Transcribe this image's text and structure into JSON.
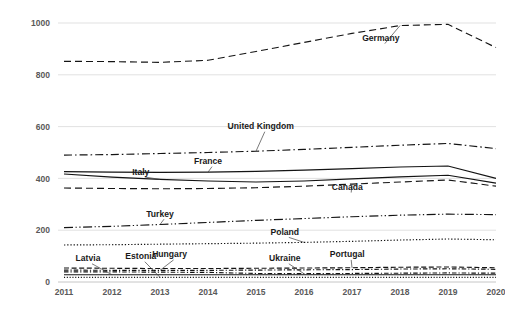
{
  "chart_data": {
    "type": "line",
    "title": "",
    "subtitle": "",
    "xlabel": "",
    "ylabel": "",
    "x": [
      2011,
      2012,
      2013,
      2014,
      2015,
      2016,
      2017,
      2018,
      2019,
      2020
    ],
    "categories": [
      "2011",
      "2012",
      "2013",
      "2014",
      "2015",
      "2016",
      "2017",
      "2018",
      "2019",
      "2020"
    ],
    "xlim": [
      2011,
      2020
    ],
    "ylim": [
      0,
      1000
    ],
    "yticks": [
      0,
      200,
      400,
      600,
      800,
      1000
    ],
    "ytick_labels": [
      "0",
      "200",
      "400",
      "600",
      "800",
      "1000"
    ],
    "grid": true,
    "grid_axis": "y",
    "legend": "inline-callout-labels",
    "legend_position": "none",
    "series": [
      {
        "name": "Germany",
        "dash": "dashed",
        "label_x": 2017.6,
        "label_y": 930,
        "values": [
          852,
          851,
          848,
          856,
          890,
          925,
          960,
          990,
          995,
          905
        ]
      },
      {
        "name": "United Kingdom",
        "dash": "dash-dot",
        "label_x": 2015.1,
        "label_y": 590,
        "values": [
          490,
          492,
          496,
          500,
          505,
          512,
          520,
          528,
          535,
          515
        ]
      },
      {
        "name": "France",
        "dash": "solid",
        "label_x": 2014.0,
        "label_y": 455,
        "values": [
          426,
          424,
          423,
          424,
          427,
          432,
          438,
          444,
          448,
          400
        ]
      },
      {
        "name": "Italy",
        "dash": "solid",
        "label_x": 2012.6,
        "label_y": 415,
        "values": [
          417,
          405,
          396,
          390,
          386,
          390,
          398,
          406,
          412,
          382
        ]
      },
      {
        "name": "Canada",
        "dash": "dashed",
        "label_x": 2016.9,
        "label_y": 355,
        "values": [
          363,
          361,
          360,
          361,
          364,
          370,
          378,
          386,
          394,
          370
        ]
      },
      {
        "name": "Turkey",
        "dash": "long-dash-dot",
        "label_x": 2013.0,
        "label_y": 252,
        "values": [
          210,
          215,
          222,
          230,
          238,
          245,
          252,
          258,
          262,
          260
        ]
      },
      {
        "name": "Poland",
        "dash": "dotted",
        "label_x": 2015.6,
        "label_y": 182,
        "values": [
          143,
          144,
          146,
          148,
          150,
          153,
          157,
          162,
          166,
          163
        ]
      },
      {
        "name": "Portugal",
        "dash": "dashed-fine",
        "label_x": 2016.9,
        "label_y": 95,
        "values": [
          54,
          53,
          52,
          52,
          53,
          54,
          55,
          57,
          58,
          55
        ]
      },
      {
        "name": "Hungary",
        "dash": "dash-dot-fine",
        "label_x": 2013.2,
        "label_y": 95,
        "values": [
          46,
          45,
          45,
          45,
          46,
          47,
          48,
          50,
          51,
          49
        ]
      },
      {
        "name": "Ukraine",
        "dash": "dash-dot-fine",
        "label_x": 2015.6,
        "label_y": 80,
        "values": [
          39,
          39,
          38,
          37,
          33,
          32,
          33,
          34,
          35,
          34
        ]
      },
      {
        "name": "Latvia",
        "dash": "solid-fine",
        "label_x": 2011.5,
        "label_y": 80,
        "values": [
          28,
          28,
          28,
          28,
          28,
          28,
          28,
          28,
          28,
          28
        ]
      },
      {
        "name": "Estonia",
        "dash": "dotted-fine",
        "label_x": 2012.6,
        "label_y": 88,
        "values": [
          18,
          18,
          18,
          18,
          18,
          18,
          18,
          18,
          18,
          18
        ]
      }
    ]
  }
}
